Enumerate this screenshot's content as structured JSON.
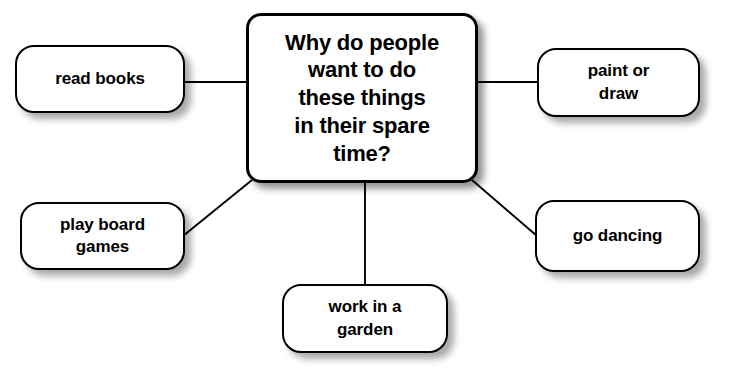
{
  "diagram": {
    "type": "mind-map",
    "background_color": "#ffffff",
    "node_fill_color": "#ffffff",
    "node_border_color": "#000000",
    "text_color": "#000000",
    "central_node": {
      "id": "central-question",
      "label": "Why do people\nwant to do\nthese things\nin their spare\ntime?",
      "x": 246,
      "y": 13,
      "width": 232,
      "height": 170
    },
    "leaf_nodes": [
      {
        "id": "read-books",
        "label": "read books",
        "x": 15,
        "y": 45,
        "width": 170,
        "height": 68
      },
      {
        "id": "paint-or-draw",
        "label": "paint or\ndraw",
        "x": 537,
        "y": 48,
        "width": 163,
        "height": 69
      },
      {
        "id": "play-board-games",
        "label": "play board\ngames",
        "x": 20,
        "y": 202,
        "width": 165,
        "height": 68
      },
      {
        "id": "go-dancing",
        "label": "go dancing",
        "x": 535,
        "y": 200,
        "width": 165,
        "height": 72
      },
      {
        "id": "work-in-a-garden",
        "label": "work in a\ngarden",
        "x": 282,
        "y": 284,
        "width": 166,
        "height": 69
      }
    ],
    "connectors": [
      {
        "id": "connector-read-books",
        "from": "central-question",
        "to": "read-books",
        "x1": 185,
        "y1": 82,
        "x2": 246,
        "y2": 82
      },
      {
        "id": "connector-paint-or-draw",
        "from": "central-question",
        "to": "paint-or-draw",
        "x1": 478,
        "y1": 82,
        "x2": 537,
        "y2": 82
      },
      {
        "id": "connector-play-board-games",
        "from": "central-question",
        "to": "play-board-games",
        "x1": 252,
        "y1": 180,
        "x2": 183,
        "y2": 236
      },
      {
        "id": "connector-go-dancing",
        "from": "central-question",
        "to": "go-dancing",
        "x1": 472,
        "y1": 180,
        "x2": 537,
        "y2": 236
      },
      {
        "id": "connector-work-in-a-garden",
        "from": "central-question",
        "to": "work-in-a-garden",
        "x1": 365,
        "y1": 183,
        "x2": 365,
        "y2": 284
      }
    ]
  }
}
